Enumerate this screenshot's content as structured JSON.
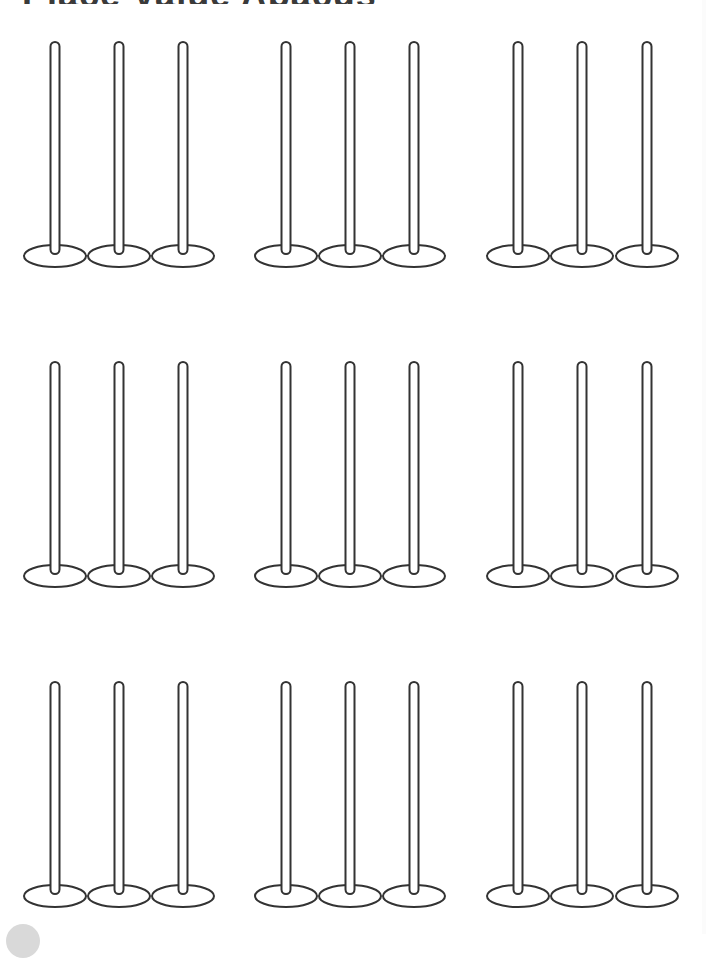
{
  "page": {
    "title_partial": "Place Value Abacus",
    "background": "#ffffff",
    "stroke_color": "#333333"
  },
  "abacus": {
    "rows": [
      {
        "rod_top": 42,
        "base_y": 256
      },
      {
        "rod_top": 362,
        "base_y": 576
      },
      {
        "rod_top": 682,
        "base_y": 896
      }
    ],
    "groups": [
      {
        "rod_x": [
          55,
          119,
          183
        ]
      },
      {
        "rod_x": [
          286,
          350,
          414
        ]
      },
      {
        "rod_x": [
          518,
          582,
          647
        ]
      }
    ],
    "rod_width": 9,
    "base_rx": 31,
    "base_ry": 11,
    "rods_per_group": 3,
    "groups_per_row": 3,
    "row_count": 3
  },
  "decor": {
    "corner_circle_color": "#d9d9d9"
  }
}
